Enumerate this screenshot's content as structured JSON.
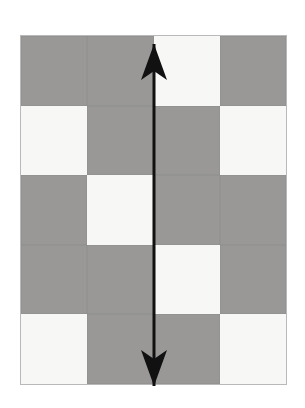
{
  "figure": {
    "title": "",
    "caption": "",
    "background_color": "#ffffff",
    "panel": {
      "name": "checkerboard-grid",
      "columns": 4,
      "rows": 5,
      "left": 20,
      "top": 35,
      "width": 267,
      "height": 350,
      "border_color": "#b9b9b9"
    },
    "colors": {
      "dark_cell": "#999897",
      "light_cell": "#f7f7f5",
      "arrow": "#111111",
      "panel_border": "#b9b9b9",
      "background": "#ffffff"
    },
    "cells": [
      [
        {
          "shade": "dark",
          "label": ""
        },
        {
          "shade": "dark",
          "label": ""
        },
        {
          "shade": "light",
          "label": ""
        },
        {
          "shade": "dark",
          "label": ""
        }
      ],
      [
        {
          "shade": "light",
          "label": ""
        },
        {
          "shade": "dark",
          "label": ""
        },
        {
          "shade": "dark",
          "label": ""
        },
        {
          "shade": "light",
          "label": ""
        }
      ],
      [
        {
          "shade": "dark",
          "label": ""
        },
        {
          "shade": "light",
          "label": ""
        },
        {
          "shade": "dark",
          "label": ""
        },
        {
          "shade": "dark",
          "label": ""
        }
      ],
      [
        {
          "shade": "dark",
          "label": ""
        },
        {
          "shade": "dark",
          "label": ""
        },
        {
          "shade": "light",
          "label": ""
        },
        {
          "shade": "dark",
          "label": ""
        }
      ],
      [
        {
          "shade": "light",
          "label": ""
        },
        {
          "shade": "dark",
          "label": ""
        },
        {
          "shade": "dark",
          "label": ""
        },
        {
          "shade": "light",
          "label": ""
        }
      ]
    ],
    "annotation": {
      "type": "double-headed-arrow",
      "orientation": "vertical",
      "x": 154,
      "y_top": 44,
      "y_bottom": 386,
      "shaft_width": 3,
      "head_width": 26,
      "head_length": 30,
      "color": "#111111"
    }
  }
}
